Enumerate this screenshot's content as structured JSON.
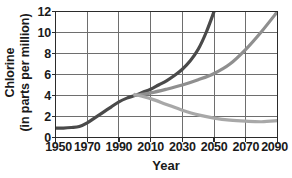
{
  "chart_data": {
    "type": "line",
    "title": "",
    "xlabel": "Year",
    "ylabel": "Chlorine (in parts per million)",
    "ylabel_line1": "Chlorine",
    "ylabel_line2": "(in parts per million)",
    "xlim": [
      1950,
      2090
    ],
    "ylim": [
      0,
      12
    ],
    "xticks": [
      1950,
      1970,
      1990,
      2010,
      2030,
      2050,
      2070,
      2090
    ],
    "yticks": [
      0,
      2,
      4,
      6,
      8,
      10,
      12
    ],
    "xtick_labels": [
      "1950",
      "1970",
      "1990",
      "2010",
      "2030",
      "2050",
      "2070",
      "2090"
    ],
    "ytick_labels": [
      "0",
      "2",
      "4",
      "6",
      "8",
      "10",
      "12"
    ],
    "grid": true,
    "legend": "none",
    "series": [
      {
        "name": "historical-and-steep-rise",
        "color": "#4a4a4a",
        "linewidth": 3.2,
        "x": [
          1950,
          1955,
          1960,
          1965,
          1970,
          1975,
          1980,
          1985,
          1990,
          1995,
          2000,
          2005,
          2010,
          2015,
          2020,
          2025,
          2030,
          2035,
          2040,
          2045,
          2050
        ],
        "y": [
          0.9,
          0.9,
          0.95,
          1.05,
          1.4,
          1.9,
          2.4,
          2.9,
          3.4,
          3.75,
          4.0,
          4.3,
          4.6,
          5.0,
          5.4,
          5.9,
          6.5,
          7.3,
          8.4,
          10.0,
          12.0
        ]
      },
      {
        "name": "moderate-rise",
        "color": "#8f8f8f",
        "linewidth": 3.2,
        "x": [
          2000,
          2010,
          2020,
          2030,
          2040,
          2050,
          2060,
          2070,
          2080,
          2090
        ],
        "y": [
          4.0,
          4.25,
          4.6,
          5.0,
          5.5,
          6.1,
          7.0,
          8.4,
          10.1,
          12.0
        ]
      },
      {
        "name": "decline-and-plateau",
        "color": "#a8a8a8",
        "linewidth": 3.2,
        "x": [
          2000,
          2010,
          2020,
          2030,
          2040,
          2050,
          2060,
          2070,
          2080,
          2090
        ],
        "y": [
          4.1,
          3.7,
          3.15,
          2.6,
          2.15,
          1.85,
          1.65,
          1.55,
          1.5,
          1.6
        ]
      }
    ]
  },
  "axes": {
    "axis_color": "#2b2b2b",
    "grid_color": "#6e6e6e",
    "plot_bg": "#ffffff"
  }
}
